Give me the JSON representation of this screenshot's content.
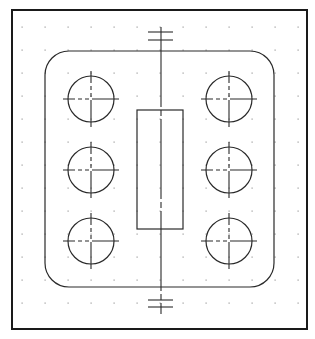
{
  "drawing": {
    "frame": {
      "x": 12,
      "y": 10,
      "width": 295,
      "height": 319
    },
    "grid": {
      "spacing": 23,
      "origin_x": 22,
      "origin_y": 27,
      "cols": 13,
      "rows": 13,
      "color": "#9a9a9a"
    },
    "plate": {
      "x": 45,
      "y": 51,
      "width": 229,
      "height": 236,
      "corner_radius": 24
    },
    "slot": {
      "x": 137,
      "y": 110,
      "width": 46,
      "height": 119
    },
    "centerline": {
      "x": 161,
      "y1": 27,
      "y2": 314
    },
    "top_marks": [
      {
        "y": 32,
        "x1": 148,
        "x2": 173
      },
      {
        "y": 40,
        "x1": 148,
        "x2": 173
      }
    ],
    "bottom_marks": [
      {
        "y": 300,
        "x1": 148,
        "x2": 173
      },
      {
        "y": 307,
        "x1": 148,
        "x2": 173
      }
    ],
    "holes": [
      {
        "cx": 91,
        "cy": 99,
        "r": 23
      },
      {
        "cx": 91,
        "cy": 170,
        "r": 23
      },
      {
        "cx": 91,
        "cy": 241,
        "r": 23
      },
      {
        "cx": 229,
        "cy": 99,
        "r": 23
      },
      {
        "cx": 229,
        "cy": 170,
        "r": 23
      },
      {
        "cx": 229,
        "cy": 241,
        "r": 23
      }
    ],
    "stroke_color": "#2a2a2a",
    "background": "#ffffff"
  }
}
